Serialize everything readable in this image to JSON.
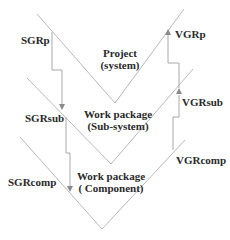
{
  "levels": [
    {
      "title": "Project",
      "subtitle": "(system)"
    },
    {
      "title": "Work package",
      "subtitle": "(Sub-system)"
    },
    {
      "title": "Work package",
      "subtitle": "( Component)"
    }
  ],
  "left_labels": [
    "SGRp",
    "SGRsub",
    "SGRcomp"
  ],
  "right_labels": [
    "VGRp",
    "VGRsub",
    "VGRcomp"
  ],
  "colors": {
    "line": "#b4b4b4",
    "arrow": "#8a8a8a",
    "text": "#2a2a2a"
  }
}
